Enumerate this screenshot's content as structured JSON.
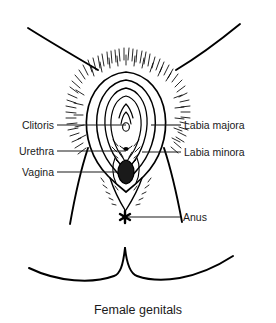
{
  "figure": {
    "caption": "Female genitals",
    "type": "anatomical-line-diagram",
    "style": {
      "background_color": "#ffffff",
      "line_color": "#000000",
      "text_color": "#1a1a1a"
    }
  },
  "labels": {
    "left": [
      {
        "id": "clitoris",
        "text": "Clitoris",
        "side": "left",
        "leader_y": 125
      },
      {
        "id": "urethra",
        "text": "Urethra",
        "side": "left",
        "leader_y": 151
      },
      {
        "id": "vagina",
        "text": "Vagina",
        "side": "left",
        "leader_y": 172
      }
    ],
    "right": [
      {
        "id": "labia-majora",
        "text": "Labia majora",
        "side": "right",
        "leader_y": 125
      },
      {
        "id": "labia-minora",
        "text": "Labia minora",
        "side": "right",
        "leader_y": 152
      },
      {
        "id": "anus",
        "text": "Anus",
        "side": "right",
        "leader_y": 217
      }
    ]
  },
  "parts": {
    "pubic_hair": "pubic-hair-region",
    "labia_majora_outline": "labia-majora-outline",
    "labia_minora_outline": "labia-minora-outline",
    "clitoris_mark": "clitoris-mark",
    "urethra_mark": "urethral-opening",
    "vaginal_opening": "vaginal-opening",
    "anus_mark": "anus-mark",
    "thigh_left": "left-inner-thigh",
    "thigh_right": "right-inner-thigh",
    "buttock_left": "left-buttock-curve",
    "buttock_right": "right-buttock-curve"
  }
}
